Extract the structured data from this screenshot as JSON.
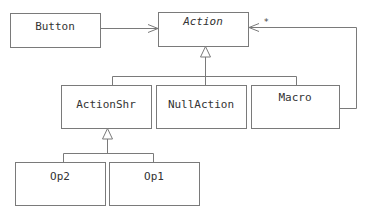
{
  "diagram": {
    "type": "uml-class-diagram",
    "classes": [
      {
        "id": "button",
        "name": "Button",
        "abstract": false
      },
      {
        "id": "action",
        "name": "Action",
        "abstract": true
      },
      {
        "id": "actionshr",
        "name": "ActionShr",
        "abstract": false
      },
      {
        "id": "nullaction",
        "name": "NullAction",
        "abstract": false
      },
      {
        "id": "macro",
        "name": "Macro",
        "abstract": false
      },
      {
        "id": "op2",
        "name": "Op2",
        "abstract": false
      },
      {
        "id": "op1",
        "name": "Op1",
        "abstract": false
      }
    ],
    "relationships": [
      {
        "type": "association",
        "from": "Button",
        "to": "Action",
        "navigable": true
      },
      {
        "type": "aggregation",
        "from": "Macro",
        "to": "Action",
        "multiplicity": "*"
      },
      {
        "type": "generalization",
        "from": "ActionShr",
        "to": "Action"
      },
      {
        "type": "generalization",
        "from": "NullAction",
        "to": "Action"
      },
      {
        "type": "generalization",
        "from": "Macro",
        "to": "Action"
      },
      {
        "type": "generalization",
        "from": "Op2",
        "to": "ActionShr"
      },
      {
        "type": "generalization",
        "from": "Op1",
        "to": "ActionShr"
      }
    ],
    "multiplicity_label": "*",
    "colors": {
      "stroke": "#7a7a7a",
      "text": "#333333",
      "background": "#ffffff"
    }
  }
}
